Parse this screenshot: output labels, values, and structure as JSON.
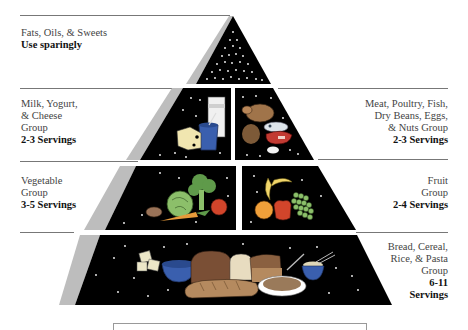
{
  "diagram": {
    "groups": [
      {
        "id": "fats",
        "lines": [
          "Fats, Oils, & Sweets"
        ],
        "servings": "Use sparingly",
        "side": "left"
      },
      {
        "id": "milk",
        "lines": [
          "Milk, Yogurt,",
          "& Cheese",
          "Group"
        ],
        "servings": "2-3 Servings",
        "side": "left"
      },
      {
        "id": "meat",
        "lines": [
          "Meat, Poultry, Fish,",
          "Dry Beans, Eggs,",
          "& Nuts Group"
        ],
        "servings": "2-3 Servings",
        "side": "right"
      },
      {
        "id": "vegetable",
        "lines": [
          "Vegetable",
          "Group"
        ],
        "servings": "3-5 Servings",
        "side": "left"
      },
      {
        "id": "fruit",
        "lines": [
          "Fruit",
          "Group"
        ],
        "servings": "2-4 Servings",
        "side": "right"
      },
      {
        "id": "bread",
        "lines": [
          "Bread, Cereal,",
          "Rice, & Pasta",
          "Group"
        ],
        "servings_lines": [
          "6-11",
          "Servings"
        ],
        "side": "right"
      }
    ],
    "colors": {
      "tier_fill": "#000000",
      "side_shade": "#bdbdbd",
      "rule": "#777777",
      "dairy_blue": "#3a5fae",
      "meat_brown": "#a0744a",
      "veg_green": "#5f9a4a",
      "tomato_red": "#d2452b",
      "bread_tan": "#b58a5f"
    }
  }
}
